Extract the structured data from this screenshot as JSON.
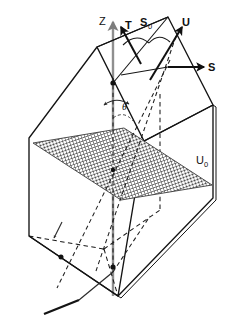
{
  "figure": {
    "background_color": "#ffffff",
    "line_color": "#101010",
    "axis_color": "#8a8a8a",
    "mesh_color": "#4a4a4a",
    "width": 234,
    "height": 318
  },
  "labels": {
    "z_axis": "Z",
    "t_vector": "T",
    "s0_vector": "S",
    "s0_subscript": "0",
    "u_vector": "U",
    "s_vector": "S",
    "u0_vector": "U",
    "u0_subscript": "0",
    "theta_angle": "θ"
  },
  "elements": {
    "slab": "rectangular-slab",
    "mesh_plane": "scattering-plane-mesh",
    "hidden_edges": "dashed",
    "vertex_markers": 3,
    "vectors": [
      "Z",
      "T",
      "S0",
      "U",
      "S",
      "U0"
    ],
    "brace": "s0-brace-arc"
  }
}
